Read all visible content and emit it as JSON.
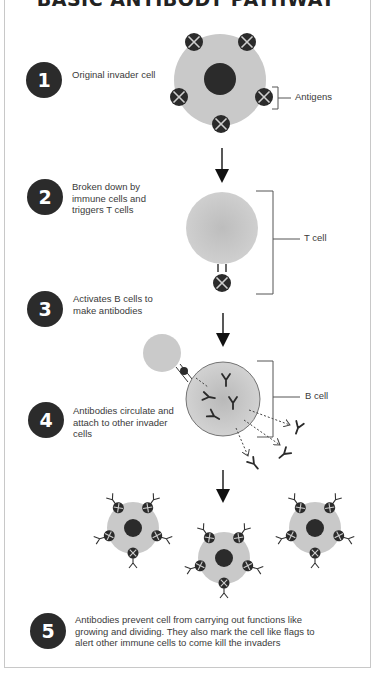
{
  "title": "BASIC ANTIBODY PATHWAY",
  "steps": [
    {
      "number": "1",
      "text": "Original invader cell"
    },
    {
      "number": "2",
      "text": "Broken down by immune cells and triggers T cells"
    },
    {
      "number": "3",
      "text": "Activates B cells to make antibodies"
    },
    {
      "number": "4",
      "text": "Antibodies circulate and attach to other invader cells"
    },
    {
      "number": "5",
      "text": "Antibodies prevent cell from carrying out functions like growing and dividing. They also mark the cell like flags to alert other immune cells to come kill the invaders"
    }
  ],
  "labels": {
    "antigens": "Antigens",
    "t_cell": "T cell",
    "b_cell": "B cell"
  },
  "colors": {
    "cell_fill": "#c9c9c9",
    "nucleus": "#2b2b2b",
    "antigen": "#2b2b2b",
    "badge": "#2b2b2b",
    "bracket": "#555555"
  }
}
